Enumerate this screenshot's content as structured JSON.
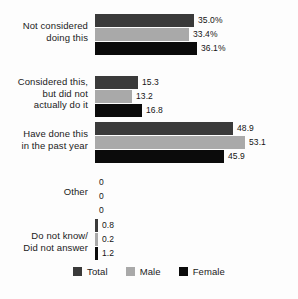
{
  "chart_data": {
    "type": "bar",
    "orientation": "horizontal",
    "title": "",
    "subtitle": "",
    "xlabel": "",
    "ylabel": "",
    "xlim": [
      0,
      56
    ],
    "grid": false,
    "legend_position": "bottom",
    "categories": [
      "Not considered doing this",
      "Considered this, but did not actually do it",
      "Have done this in the past year",
      "Other",
      "Do not know/ Did not answer"
    ],
    "category_lines": [
      [
        "Not considered",
        "doing this"
      ],
      [
        "Considered this,",
        "but did not",
        "actually do it"
      ],
      [
        "Have done this",
        "in the past year"
      ],
      [
        "Other"
      ],
      [
        "Do not know/",
        "Did not answer"
      ]
    ],
    "series": [
      {
        "name": "Total",
        "color": "#3a3a3a",
        "values": [
          35.0,
          15.3,
          48.9,
          0,
          0.8
        ],
        "labels": [
          "35.0%",
          "15.3",
          "48.9",
          "0",
          "0.8"
        ]
      },
      {
        "name": "Male",
        "color": "#a9a9a9",
        "values": [
          33.4,
          13.2,
          53.1,
          0,
          0.2
        ],
        "labels": [
          "33.4%",
          "13.2",
          "53.1",
          "0",
          "0.2"
        ]
      },
      {
        "name": "Female",
        "color": "#0b0b0b",
        "values": [
          36.1,
          16.8,
          45.9,
          0,
          1.2
        ],
        "labels": [
          "36.1%",
          "16.8",
          "45.9",
          "0",
          "1.2"
        ]
      }
    ]
  },
  "legend": {
    "items": [
      {
        "label": "Total",
        "color": "#3a3a3a"
      },
      {
        "label": "Male",
        "color": "#a9a9a9"
      },
      {
        "label": "Female",
        "color": "#0b0b0b"
      }
    ]
  },
  "layout": {
    "bar_origin_x": 95,
    "pixels_per_unit": 2.82,
    "group_tops": [
      14,
      76,
      122,
      176,
      219
    ],
    "label_tops": [
      20,
      76,
      128,
      186,
      230
    ]
  }
}
